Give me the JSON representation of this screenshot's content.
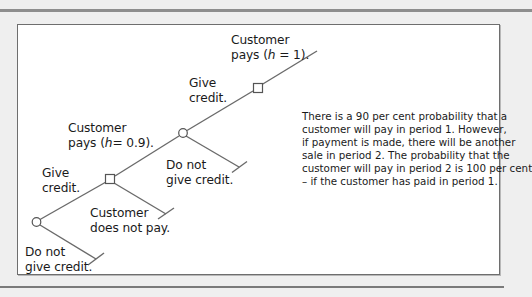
{
  "diagram": {
    "type": "decision-tree",
    "labels": {
      "top_payoff_line1": "Customer",
      "top_payoff_line2_pre": "pays (",
      "top_payoff_var": "h",
      "top_payoff_line2_post": " = 1).",
      "give_credit_2_line1": "Give",
      "give_credit_2_line2": "credit.",
      "customer_pays_1_line1": "Customer",
      "customer_pays_1_line2_pre": "pays (",
      "customer_pays_1_var": "h",
      "customer_pays_1_line2_post": "= 0.9).",
      "no_credit_2_line1": "Do not",
      "no_credit_2_line2": "give credit.",
      "give_credit_1_line1": "Give",
      "give_credit_1_line2": "credit.",
      "not_pay_line1": "Customer",
      "not_pay_line2": "does not pay.",
      "no_credit_1_line1": "Do not",
      "no_credit_1_line2": "give credit."
    },
    "nodes": [
      {
        "id": "decision-1",
        "shape": "circle",
        "period": 1
      },
      {
        "id": "chance-1",
        "shape": "square",
        "probability_pay": 0.9
      },
      {
        "id": "decision-2",
        "shape": "circle",
        "period": 2
      },
      {
        "id": "chance-2",
        "shape": "square",
        "probability_pay": 1
      }
    ],
    "note_lines": [
      "There is a 90 per cent probability that a",
      "customer will pay in period 1. However,",
      "if payment is made, there will be another",
      "sale in period 2. The probability that the",
      "customer will pay in period 2 is 100 per cent",
      "– if the customer has paid in period 1."
    ]
  }
}
